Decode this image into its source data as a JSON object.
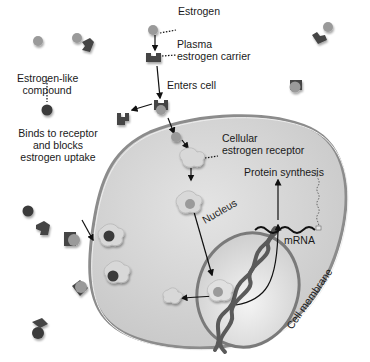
{
  "labels": {
    "estrogen": "Estrogen",
    "carrier_line1": "Plasma",
    "carrier_line2": "estrogen carrier",
    "enters_cell": "Enters cell",
    "estrogen_like_line1": "Estrogen-like",
    "estrogen_like_line2": "compound",
    "binds_line1": "Binds to receptor",
    "binds_line2": "and blocks",
    "binds_line3": "estrogen uptake",
    "receptor_line1": "Cellular",
    "receptor_line2": "estrogen receptor",
    "protein_synthesis": "Protein synthesis",
    "mrna": "mRNA",
    "nucleus": "Nucleus",
    "cell_membrane": "Cell membrane"
  },
  "colors": {
    "estrogen": "#9a9a9a",
    "estrogen_like": "#3a3a3a",
    "carrier": "#4a4a4a",
    "receptor": "#d8d8d8",
    "cell_fill": "#d4d4d4",
    "cell_edge": "#8c8c8c",
    "nucleus_fill": "#e6e6e6",
    "dna": "#5a5a5a",
    "arrow": "#111111"
  },
  "icons": {
    "estrogen": "gray-circle",
    "estrogen_like": "dark-circle",
    "carrier": "dark-cup-shape",
    "receptor": "light-puzzle-shape"
  }
}
